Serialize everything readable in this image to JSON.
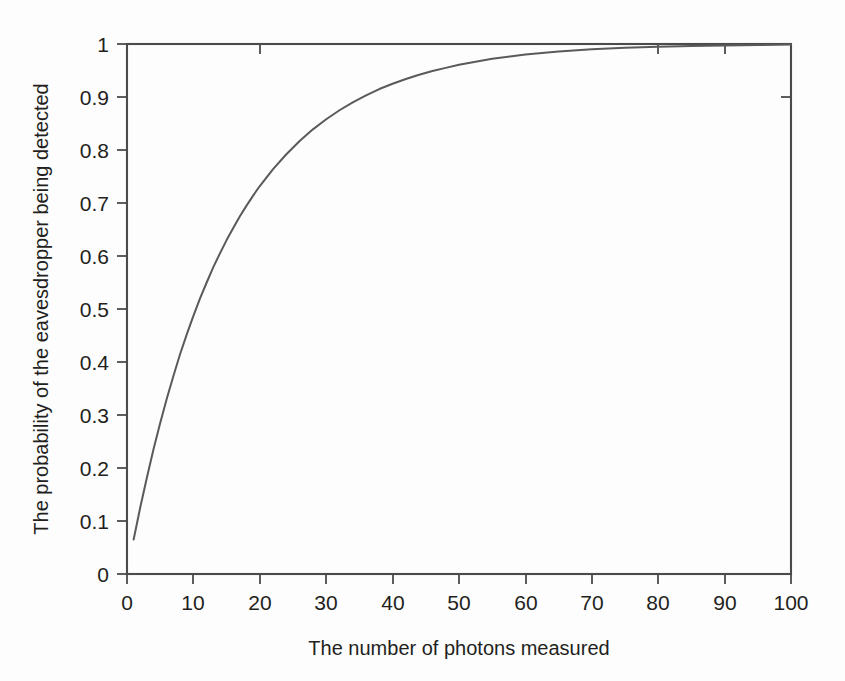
{
  "chart_data": {
    "type": "line",
    "title": "",
    "xlabel": "The number of photons measured",
    "ylabel": "The probability of the eavesdropper being detected",
    "xlim": [
      0,
      100
    ],
    "ylim": [
      0,
      1
    ],
    "grid": false,
    "legend": null,
    "line_color": "#5a5a5a",
    "axis_color": "#4b4b4b",
    "background_color": "#ffffff",
    "xticks": [
      0,
      10,
      20,
      30,
      40,
      50,
      60,
      70,
      80,
      90,
      100
    ],
    "xtick_labels": [
      "0",
      "10",
      "20",
      "30",
      "40",
      "50",
      "60",
      "70",
      "80",
      "90",
      "100"
    ],
    "yticks": [
      0,
      0.1,
      0.2,
      0.3,
      0.4,
      0.5,
      0.6,
      0.7,
      0.8,
      0.9,
      1
    ],
    "ytick_labels": [
      "0",
      "0.1",
      "0.2",
      "0.3",
      "0.4",
      "0.5",
      "0.6",
      "0.7",
      "0.8",
      "0.9",
      "1"
    ],
    "series": [
      {
        "name": "probability of detection",
        "formula": "1 - (15/16)^n",
        "x": [
          1,
          2,
          3,
          4,
          5,
          6,
          7,
          8,
          9,
          10,
          11,
          12,
          13,
          14,
          15,
          16,
          17,
          18,
          19,
          20,
          22,
          24,
          26,
          28,
          30,
          32,
          34,
          36,
          38,
          40,
          42,
          44,
          46,
          48,
          50,
          55,
          60,
          65,
          70,
          75,
          80,
          85,
          90,
          95,
          100
        ],
        "y": [
          0.065,
          0.126,
          0.182,
          0.236,
          0.285,
          0.331,
          0.374,
          0.415,
          0.452,
          0.487,
          0.52,
          0.55,
          0.579,
          0.605,
          0.63,
          0.653,
          0.675,
          0.695,
          0.714,
          0.732,
          0.764,
          0.792,
          0.817,
          0.839,
          0.858,
          0.875,
          0.89,
          0.903,
          0.915,
          0.925,
          0.934,
          0.942,
          0.949,
          0.955,
          0.961,
          0.972,
          0.98,
          0.986,
          0.99,
          0.993,
          0.995,
          0.996,
          0.997,
          0.998,
          0.999
        ]
      }
    ]
  },
  "axes": {
    "y_title": "The probability of the eavesdropper being detected",
    "x_title": "The number of photons measured"
  },
  "ticks": {
    "x": [
      "0",
      "10",
      "20",
      "30",
      "40",
      "50",
      "60",
      "70",
      "80",
      "90",
      "100"
    ],
    "y": [
      "1",
      "0.9",
      "0.8",
      "0.7",
      "0.6",
      "0.5",
      "0.4",
      "0.3",
      "0.2",
      "0.1",
      "0"
    ]
  }
}
